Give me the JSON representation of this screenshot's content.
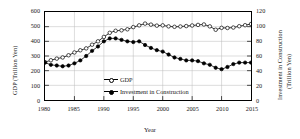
{
  "chart_data": {
    "type": "line",
    "title": "",
    "xlabel": "Year",
    "ylabel": "GDP (Trillion  Yen)",
    "ylabel_right": "Investment in Construction (Trillion  Yen)",
    "xlim": [
      1980,
      2015
    ],
    "ylim": [
      0,
      600
    ],
    "ylim_right": [
      0,
      120
    ],
    "xticks": [
      1980,
      1985,
      1990,
      1995,
      2000,
      2005,
      2010,
      2015
    ],
    "yticks": [
      0,
      100,
      200,
      300,
      400,
      500,
      600
    ],
    "yticks_right": [
      0,
      20,
      40,
      60,
      80,
      100,
      120
    ],
    "grid": true,
    "legend_position": "lower-center-inside",
    "x": [
      1980,
      1981,
      1982,
      1983,
      1984,
      1985,
      1986,
      1987,
      1988,
      1989,
      1990,
      1991,
      1992,
      1993,
      1994,
      1995,
      1996,
      1997,
      1998,
      1999,
      2000,
      2001,
      2002,
      2003,
      2004,
      2005,
      2006,
      2007,
      2008,
      2009,
      2010,
      2011,
      2012,
      2013,
      2014,
      2015
    ],
    "series": [
      {
        "name": "GDP",
        "axis": "left",
        "marker": "open-circle",
        "values": [
          258,
          271,
          282,
          290,
          305,
          324,
          339,
          352,
          377,
          400,
          430,
          458,
          472,
          475,
          482,
          497,
          509,
          521,
          514,
          507,
          509,
          502,
          499,
          501,
          504,
          508,
          512,
          515,
          502,
          479,
          492,
          491,
          494,
          503,
          510,
          518
        ]
      },
      {
        "name": "Investment in Construction",
        "axis": "right",
        "marker": "filled-circle",
        "values": [
          51,
          48,
          47,
          46,
          47,
          50,
          54,
          60,
          67,
          73,
          80,
          84,
          84,
          82,
          80,
          79,
          80,
          75,
          71,
          68,
          66,
          62,
          58,
          56,
          54,
          54,
          53,
          50,
          48,
          44,
          42,
          45,
          49,
          51,
          51,
          51
        ]
      }
    ]
  },
  "legend": {
    "gdp_label": "GDP",
    "investment_label": "Investment in Construction"
  }
}
